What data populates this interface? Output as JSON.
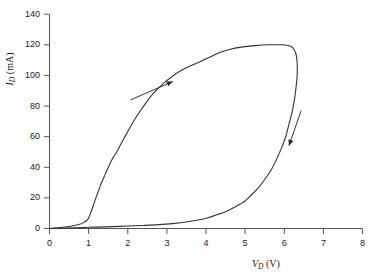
{
  "chart_data": {
    "type": "line",
    "title": "",
    "xlabel": "V_D (V)",
    "ylabel": "I_D (mA)",
    "xlim": [
      0,
      8
    ],
    "ylim": [
      0,
      140
    ],
    "xticks": [
      0,
      1,
      2,
      3,
      4,
      5,
      6,
      7,
      8
    ],
    "yticks": [
      0,
      20,
      40,
      60,
      80,
      100,
      120,
      140
    ],
    "grid": false,
    "legend": null,
    "series": [
      {
        "name": "forward sweep (upper branch)",
        "direction": "increasing voltage",
        "points": [
          [
            0.0,
            0.0
          ],
          [
            0.2,
            0.5
          ],
          [
            0.4,
            1.0
          ],
          [
            0.6,
            1.8
          ],
          [
            0.75,
            2.6
          ],
          [
            0.88,
            4.0
          ],
          [
            0.98,
            6.0
          ],
          [
            1.05,
            10.0
          ],
          [
            1.12,
            15.0
          ],
          [
            1.2,
            21.0
          ],
          [
            1.3,
            28.0
          ],
          [
            1.4,
            34.0
          ],
          [
            1.52,
            41.0
          ],
          [
            1.62,
            46.0
          ],
          [
            1.72,
            50.0
          ],
          [
            1.82,
            55.0
          ],
          [
            1.95,
            61.0
          ],
          [
            2.08,
            67.0
          ],
          [
            2.22,
            73.0
          ],
          [
            2.38,
            79.0
          ],
          [
            2.55,
            85.0
          ],
          [
            2.72,
            90.0
          ],
          [
            2.92,
            95.0
          ],
          [
            3.12,
            99.0
          ],
          [
            3.35,
            103.0
          ],
          [
            3.58,
            106.0
          ],
          [
            3.85,
            109.0
          ],
          [
            4.1,
            112.0
          ],
          [
            4.35,
            115.0
          ],
          [
            4.6,
            117.0
          ],
          [
            4.9,
            118.5
          ],
          [
            5.25,
            119.5
          ],
          [
            5.6,
            120.0
          ],
          [
            5.9,
            120.0
          ],
          [
            6.1,
            119.5
          ],
          [
            6.22,
            118.0
          ],
          [
            6.3,
            114.0
          ],
          [
            6.33,
            108.0
          ],
          [
            6.33,
            100.0
          ],
          [
            6.3,
            92.0
          ],
          [
            6.26,
            84.0
          ],
          [
            6.2,
            76.0
          ],
          [
            6.12,
            68.0
          ],
          [
            6.04,
            60.0
          ]
        ]
      },
      {
        "name": "reverse sweep (lower branch)",
        "direction": "decreasing voltage",
        "points": [
          [
            6.04,
            60.0
          ],
          [
            5.92,
            52.0
          ],
          [
            5.8,
            45.0
          ],
          [
            5.66,
            38.0
          ],
          [
            5.5,
            32.0
          ],
          [
            5.32,
            26.0
          ],
          [
            5.12,
            21.0
          ],
          [
            5.0,
            18.0
          ],
          [
            4.88,
            16.0
          ],
          [
            4.7,
            13.5
          ],
          [
            4.5,
            11.0
          ],
          [
            4.28,
            9.0
          ],
          [
            4.05,
            7.0
          ],
          [
            3.8,
            5.5
          ],
          [
            3.5,
            4.2
          ],
          [
            3.15,
            3.2
          ],
          [
            2.8,
            2.5
          ],
          [
            2.4,
            2.0
          ],
          [
            2.0,
            1.6
          ],
          [
            1.6,
            1.2
          ],
          [
            1.2,
            0.9
          ],
          [
            0.9,
            0.7
          ],
          [
            0.6,
            0.4
          ],
          [
            0.3,
            0.2
          ],
          [
            0.0,
            0.0
          ]
        ]
      }
    ],
    "annotations": [
      {
        "name": "forward-direction-arrow",
        "type": "arrow",
        "from": [
          2.07,
          84.0
        ],
        "to": [
          3.15,
          96.0
        ],
        "label": ""
      },
      {
        "name": "reverse-direction-arrow",
        "type": "arrow",
        "from": [
          6.43,
          77.0
        ],
        "to": [
          6.12,
          54.0
        ],
        "label": ""
      }
    ],
    "axis_color": "#555555",
    "curve_color": "#333333",
    "background": "#ffffff"
  },
  "axes": {
    "y_tick_labels": [
      "0",
      "20",
      "40",
      "60",
      "80",
      "100",
      "120",
      "140"
    ],
    "x_tick_labels": [
      "0",
      "1",
      "2",
      "3",
      "4",
      "5",
      "6",
      "7",
      "8"
    ],
    "y_title_main": "I",
    "y_title_sub": "D",
    "y_title_unit": " (mA)",
    "x_title_main": "V",
    "x_title_sub": "D",
    "x_title_unit": " (V)"
  }
}
